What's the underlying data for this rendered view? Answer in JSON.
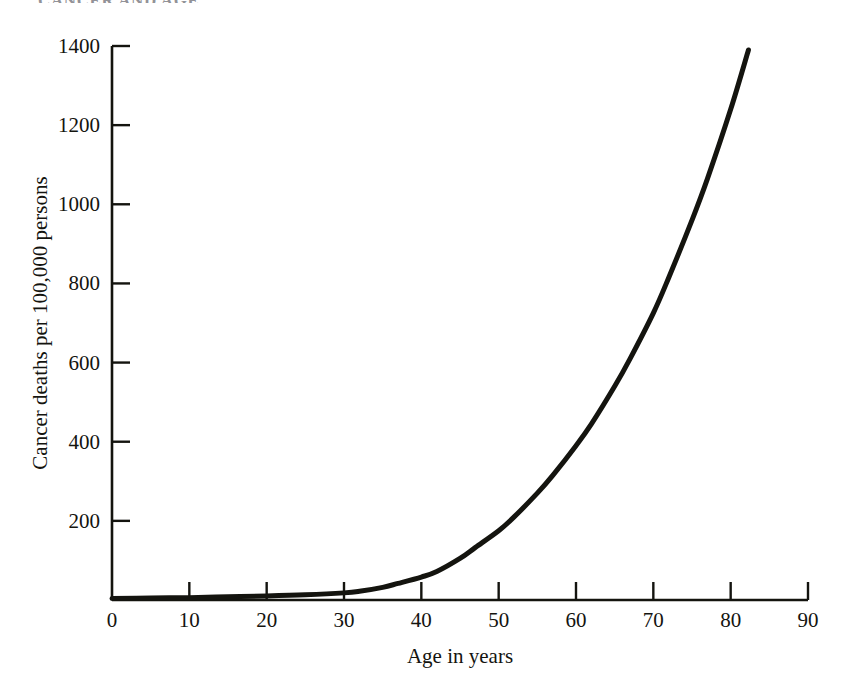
{
  "figure": {
    "caption_fragment": "CANCER AND AGE",
    "background_color": "#ffffff",
    "ink_color": "#14140f"
  },
  "chart_data": {
    "type": "line",
    "title": "",
    "subtitle": "",
    "xlabel": "Age in years",
    "ylabel": "Cancer deaths per 100,000 persons",
    "xlim": [
      0,
      90
    ],
    "ylim": [
      0,
      1400
    ],
    "xticks": [
      0,
      10,
      20,
      30,
      40,
      50,
      60,
      70,
      80,
      90
    ],
    "xtick_labels": [
      "0",
      "10",
      "20",
      "30",
      "40",
      "50",
      "60",
      "70",
      "80",
      "90"
    ],
    "yticks": [
      200,
      400,
      600,
      800,
      1000,
      1200,
      1400
    ],
    "ytick_labels": [
      "200",
      "400",
      "600",
      "800",
      "1000",
      "1200",
      "1400"
    ],
    "grid": false,
    "legend": "none",
    "tick_direction": "out",
    "line_color": "#14140f",
    "line_width": 5,
    "series": [
      {
        "name": "Cancer death rate",
        "x": [
          0,
          5,
          10,
          15,
          20,
          25,
          30,
          32,
          35,
          37,
          40,
          42,
          45,
          47,
          50,
          52,
          55,
          57,
          60,
          62,
          65,
          67,
          70,
          72,
          75,
          77,
          80,
          82.3
        ],
        "values": [
          4,
          5,
          6,
          8,
          10,
          13,
          18,
          22,
          32,
          42,
          58,
          72,
          105,
          133,
          175,
          210,
          270,
          315,
          390,
          445,
          540,
          610,
          725,
          815,
          960,
          1065,
          1240,
          1390
        ]
      }
    ],
    "annotations": []
  }
}
